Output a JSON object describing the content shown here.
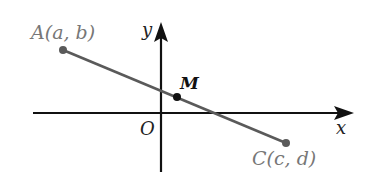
{
  "diagram": {
    "type": "coordinate-plane",
    "axes": {
      "x_label": "x",
      "y_label": "y",
      "origin_label": "O"
    },
    "points": [
      {
        "id": "A",
        "label": "A(a, b)",
        "role": "endpoint"
      },
      {
        "id": "M",
        "label": "M",
        "role": "midpoint"
      },
      {
        "id": "C",
        "label": "C(c, d)",
        "role": "endpoint"
      }
    ],
    "segment": {
      "from": "A",
      "to": "C",
      "through": "M"
    },
    "colors": {
      "axis": "#111111",
      "segment": "#5a5a5a",
      "endpoint": "#5a5a5a",
      "midpoint": "#111111",
      "endpoint_label": "#777777",
      "axis_label": "#222222"
    }
  }
}
